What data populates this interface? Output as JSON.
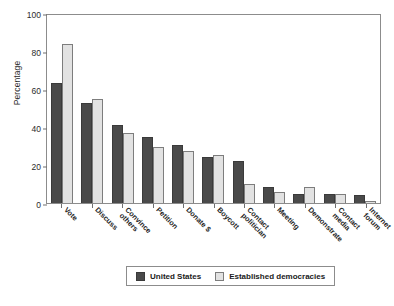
{
  "chart_data": {
    "type": "bar",
    "title": "",
    "xlabel": "",
    "ylabel": "Percentage",
    "ylim": [
      0,
      100
    ],
    "yticks": [
      0,
      20,
      40,
      60,
      80,
      100
    ],
    "grid": false,
    "legend_position": "bottom",
    "categories": [
      "Vote",
      "Discuss",
      "Convince others",
      "Petition",
      "Donate $",
      "Boycott",
      "Contact politician",
      "Meeting",
      "Demonstrate",
      "Contact media",
      "Internet forum"
    ],
    "category_lines": [
      [
        "Vote"
      ],
      [
        "Discuss"
      ],
      [
        "Convince",
        "others"
      ],
      [
        "Petition"
      ],
      [
        "Donate $"
      ],
      [
        "Boycott"
      ],
      [
        "Contact",
        "politician"
      ],
      [
        "Meeting"
      ],
      [
        "Demonstrate"
      ],
      [
        "Contact",
        "media"
      ],
      [
        "Internet",
        "forum"
      ]
    ],
    "series": [
      {
        "name": "United States",
        "color": "#4a4a4a",
        "values": [
          63,
          52.5,
          41,
          35,
          30.5,
          24,
          22,
          8.5,
          4.5,
          4.5,
          4
        ]
      },
      {
        "name": "Established democracies",
        "color": "#e2e2e2",
        "values": [
          83.5,
          55,
          37,
          29.5,
          27.5,
          25.5,
          10,
          6,
          8.5,
          4.5,
          1
        ]
      }
    ]
  },
  "legend": {
    "items": [
      {
        "label": "United States",
        "key": "us"
      },
      {
        "label": "Established democracies",
        "key": "ed"
      }
    ]
  }
}
